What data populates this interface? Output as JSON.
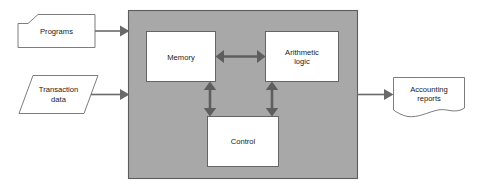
{
  "diagram": {
    "type": "block-diagram",
    "canvas": {
      "width": 484,
      "height": 193,
      "background": "#ffffff"
    },
    "colors": {
      "cpu_fill": "#a8a8a8",
      "cpu_stroke": "#5d5d5d",
      "node_fill": "#ffffff",
      "node_stroke": "#5a5a5a",
      "arrow": "#6a6a6a",
      "bi_arrow": "#5e5e5e",
      "text": "#1a1a1a"
    },
    "inputs": [
      {
        "id": "programs",
        "label": "Programs",
        "shape": "folded-corner-card"
      },
      {
        "id": "transaction-data",
        "label_line1": "Transaction",
        "label_line2": "data",
        "shape": "parallelogram"
      }
    ],
    "processor": {
      "id": "cpu",
      "shape": "rectangle",
      "fill": "#a8a8a8",
      "components": [
        {
          "id": "memory",
          "label": "Memory",
          "shape": "rectangle"
        },
        {
          "id": "arithmetic-logic",
          "label_line1": "Arithmetic",
          "label_line2": "logic",
          "shape": "rectangle"
        },
        {
          "id": "control",
          "label": "Control",
          "shape": "rectangle"
        }
      ]
    },
    "outputs": [
      {
        "id": "accounting-reports",
        "label_line1": "Accounting",
        "label_line2": "reports",
        "shape": "document-wavy-bottom"
      }
    ],
    "connectors": [
      {
        "id": "programs-to-cpu",
        "from": "programs",
        "to": "cpu",
        "style": "single-arrow",
        "direction": "right"
      },
      {
        "id": "transaction-to-cpu",
        "from": "transaction-data",
        "to": "cpu",
        "style": "single-arrow",
        "direction": "right"
      },
      {
        "id": "cpu-to-reports",
        "from": "cpu",
        "to": "accounting-reports",
        "style": "single-arrow",
        "direction": "right"
      },
      {
        "id": "memory-alu",
        "from": "memory",
        "to": "arithmetic-logic",
        "style": "double-arrow",
        "direction": "horizontal"
      },
      {
        "id": "memory-control",
        "from": "memory",
        "to": "control",
        "style": "double-arrow",
        "direction": "vertical"
      },
      {
        "id": "alu-control",
        "from": "arithmetic-logic",
        "to": "control",
        "style": "double-arrow",
        "direction": "vertical"
      }
    ]
  }
}
